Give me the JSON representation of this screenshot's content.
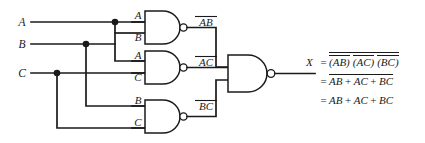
{
  "figure": {
    "type": "logic-circuit-diagram",
    "ink_color": "#1a1a1a",
    "background_color": "#ffffff"
  },
  "inputs": [
    {
      "id": "A",
      "label": "A",
      "y": 22
    },
    {
      "id": "B",
      "label": "B",
      "y": 44
    },
    {
      "id": "C",
      "label": "C",
      "y": 73
    }
  ],
  "gates": [
    {
      "id": "nand1",
      "type": "NAND",
      "input_labels": [
        "A",
        "B"
      ],
      "output_label": "AB",
      "output_label_overbar": true
    },
    {
      "id": "nand2",
      "type": "NAND",
      "input_labels": [
        "A",
        "C"
      ],
      "output_label": "AC",
      "output_label_overbar": true
    },
    {
      "id": "nand3",
      "type": "NAND",
      "input_labels": [
        "B",
        "C"
      ],
      "output_label": "BC",
      "output_label_overbar": true
    },
    {
      "id": "nand4",
      "type": "NAND",
      "input_labels": [],
      "output_label": "X",
      "output_label_overbar": false
    }
  ],
  "output": {
    "variable": "X"
  },
  "equations": [
    {
      "line": 1,
      "lhs": "X",
      "relation": "=",
      "terms": [
        "(AB)",
        "(AC)",
        "(BC)"
      ],
      "term_overbars": [
        "AB",
        "AC",
        "BC"
      ],
      "outer_overbar": true,
      "text": "X = ~((AB)~ (AC)~ (BC)~)"
    },
    {
      "line": 2,
      "lhs": "",
      "relation": "=",
      "terms": [
        "AB",
        "AC",
        "BC"
      ],
      "operator": "+",
      "outer_overbar": true,
      "text": "= ~(AB + AC + BC)"
    },
    {
      "line": 3,
      "lhs": "",
      "relation": "=",
      "terms": [
        "AB",
        "AC",
        "BC"
      ],
      "operator": "+",
      "outer_overbar": false,
      "text": "= AB + AC + BC"
    }
  ]
}
